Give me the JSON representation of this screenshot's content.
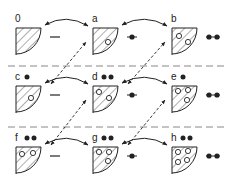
{
  "diagram": {
    "colors": {
      "ink": "#222222",
      "dash": "#888888",
      "background": "#ffffff"
    },
    "rows": [
      {
        "y": 28,
        "separator_y": null
      },
      {
        "y": 86,
        "separator_y": 66
      },
      {
        "y": 147,
        "separator_y": 127
      }
    ],
    "columns": [
      {
        "x": 16,
        "charge_symbol": "dash"
      },
      {
        "x": 93,
        "charge_symbol": "single-dot"
      },
      {
        "x": 172,
        "charge_symbol": "double-dot"
      }
    ],
    "states": [
      {
        "label": "0",
        "row": 0,
        "col": 0,
        "top_dots": 0,
        "holes": []
      },
      {
        "label": "a",
        "row": 0,
        "col": 1,
        "top_dots": 0,
        "holes": [
          [
            15,
            14
          ]
        ]
      },
      {
        "label": "b",
        "row": 0,
        "col": 2,
        "top_dots": 0,
        "holes": [
          [
            7,
            8
          ],
          [
            16,
            14
          ]
        ]
      },
      {
        "label": "c",
        "row": 1,
        "col": 0,
        "top_dots": 1,
        "holes": [
          [
            15,
            12
          ]
        ]
      },
      {
        "label": "d",
        "row": 1,
        "col": 1,
        "top_dots": 2,
        "holes": [
          [
            6,
            6
          ],
          [
            16,
            12
          ]
        ]
      },
      {
        "label": "e",
        "row": 1,
        "col": 2,
        "top_dots": 1,
        "holes": [
          [
            6,
            5
          ],
          [
            16,
            4
          ],
          [
            15,
            14
          ]
        ]
      },
      {
        "label": "f",
        "row": 2,
        "col": 0,
        "top_dots": 2,
        "holes": [
          [
            6,
            7
          ],
          [
            17,
            6
          ]
        ]
      },
      {
        "label": "g",
        "row": 2,
        "col": 1,
        "top_dots": 2,
        "holes": [
          [
            6,
            5
          ],
          [
            16,
            5
          ],
          [
            15,
            14
          ]
        ]
      },
      {
        "label": "h",
        "row": 2,
        "col": 2,
        "top_dots": 2,
        "holes": [
          [
            6,
            5
          ],
          [
            16,
            4
          ],
          [
            6,
            15
          ],
          [
            15,
            13
          ]
        ]
      }
    ]
  }
}
